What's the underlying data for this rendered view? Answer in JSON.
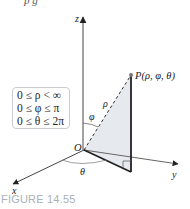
{
  "figure": {
    "caption": "FIGURE 14.55",
    "top_partial_text": "p         g",
    "point_label": "P(ρ, φ, θ)",
    "origin_label": "O",
    "axes": {
      "x": "x",
      "y": "y",
      "z": "z"
    },
    "angle_labels": {
      "phi": "φ",
      "theta": "θ",
      "rho": "ρ"
    },
    "ranges": [
      "0 ≤ ρ < ∞",
      "0 ≤ φ ≤ π",
      "0 ≤ θ ≤ 2π"
    ],
    "colors": {
      "caption": "#a9b1b8",
      "shade": "#e6e9ee",
      "lines": "#222222",
      "box_border": "#c9ccd0"
    }
  }
}
